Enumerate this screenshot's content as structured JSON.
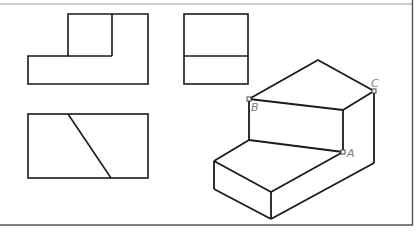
{
  "figure": {
    "type": "three-view projection with isometric drawing",
    "frame": {
      "top_line_color": "#9a9a9a",
      "border_color": "#555555"
    },
    "stroke_color": "#1a1a1a",
    "views": {
      "front_view": {
        "description": "L-shaped outline"
      },
      "side_view": {
        "description": "rectangle with horizontal dividing line"
      },
      "top_view": {
        "description": "rectangle with diagonal line"
      }
    },
    "isometric": {
      "description": "stepped solid with sloped top face",
      "points": [
        {
          "label": "A"
        },
        {
          "label": "B"
        },
        {
          "label": "C"
        }
      ]
    }
  }
}
